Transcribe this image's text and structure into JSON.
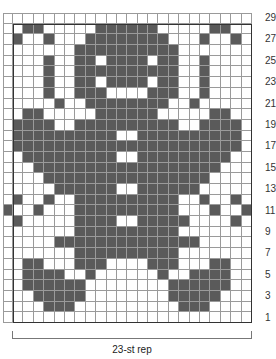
{
  "chart": {
    "rows": 29,
    "stitches": 23,
    "extra_left_column": true,
    "colors": {
      "dark": "#5a5a5a",
      "light": "#ffffff",
      "gridline": "#9a9a9a",
      "border": "#333333"
    },
    "row_labels": [
      "29",
      "27",
      "25",
      "23",
      "21",
      "19",
      "17",
      "15",
      "13",
      "11",
      "9",
      "7",
      "5",
      "3",
      "1"
    ],
    "repeat_label": "23-st rep",
    "pattern_top_to_bottom": [
      "000000000000000000000000",
      "001100000111111000001100",
      "010010001111111100010010",
      "000000011111111110000000",
      "000010011011110110010000",
      "000010011111111110010000",
      "000010011011110110010000",
      "000010011100001110010000",
      "000001001111111100100000",
      "001100000111111000001100",
      "011110011111111110011110",
      "011111111110011111111110",
      "011111111111111111111110",
      "001111111110011111111100",
      "000111111111111111111000",
      "000011111111111111110000",
      "000001111110011111100000",
      "010010011111111110010010",
      "100100011111111110001001",
      "010000011110011111000010",
      "000000011111111110000000",
      "000001111111111111100000",
      "000000011111111110000000",
      "001100011100001110001100",
      "001111001000000100111100",
      "001111110000000011111100",
      "000111110000000011111000",
      "000011100000000001110000",
      "000000000000000000000000"
    ]
  }
}
